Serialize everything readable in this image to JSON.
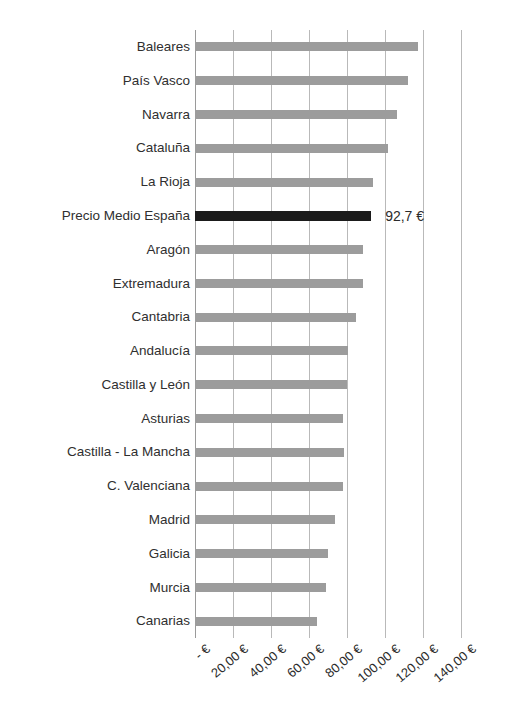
{
  "chart": {
    "type": "bar",
    "orientation": "horizontal",
    "title": "",
    "xlabel": "",
    "ylabel": "",
    "bar_color": "#9c9c9c",
    "highlight_color": "#1b1b1b",
    "gridline_color": "#b9b9b9",
    "highlight_category": "Precio Medio España",
    "highlight_value_label": "92,7 €"
  },
  "chart_data": {
    "type": "bar",
    "title": "",
    "xlabel": "",
    "ylabel": "",
    "xlim": [
      0,
      140
    ],
    "grid": true,
    "legend": "none",
    "units": "€",
    "categories": [
      "Baleares",
      "País Vasco",
      "Navarra",
      "Cataluña",
      "La Rioja",
      "Precio Medio España",
      "Aragón",
      "Extremadura",
      "Cantabria",
      "Andalucía",
      "Castilla y León",
      "Asturias",
      "Castilla - La Mancha",
      "C. Valenciana",
      "Madrid",
      "Galicia",
      "Murcia",
      "Canarias"
    ],
    "values": [
      117.4,
      112.1,
      106.3,
      101.6,
      93.7,
      92.7,
      88.4,
      88.4,
      84.7,
      80.5,
      80.0,
      77.9,
      78.4,
      78.0,
      73.7,
      70.0,
      69.0,
      64.2
    ],
    "data_labels": [
      "",
      "",
      "",
      "",
      "",
      "92,7 €",
      "",
      "",
      "",
      "",
      "",
      "",
      "",
      "",
      "",
      "",
      "",
      ""
    ],
    "xticks": [
      0,
      20,
      40,
      60,
      80,
      100,
      120,
      140
    ],
    "xticklabels": [
      "-   €",
      "20,00 €",
      "40,00 €",
      "60,00 €",
      "80,00 €",
      "100,00 €",
      "120,00 €",
      "140,00 €"
    ]
  }
}
